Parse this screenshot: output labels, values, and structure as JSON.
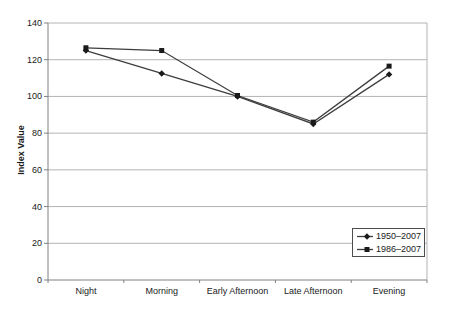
{
  "chart_data": {
    "type": "line",
    "title": "",
    "xlabel": "",
    "ylabel": "Index Value",
    "categories": [
      "Night",
      "Morning",
      "Early Afternoon",
      "Late Afternoon",
      "Evening"
    ],
    "y_ticks": [
      0,
      20,
      40,
      60,
      80,
      100,
      120,
      140
    ],
    "ylim": [
      0,
      140
    ],
    "grid": "horizontal",
    "legend_position": "lower-right",
    "series": [
      {
        "name": "1950–2007",
        "marker": "diamond",
        "color": "#3d3d3d",
        "marker_color": "#1a1a1a",
        "values": [
          125,
          112.5,
          100,
          85,
          112
        ]
      },
      {
        "name": "1986–2007",
        "marker": "square",
        "color": "#3d3d3d",
        "marker_color": "#1a1a1a",
        "values": [
          126.5,
          125,
          100.5,
          86,
          116.5
        ]
      }
    ],
    "colors": {
      "gridline": "#b3b3b3",
      "axis": "#808080",
      "text": "#1a1a1a",
      "background": "#ffffff"
    }
  }
}
